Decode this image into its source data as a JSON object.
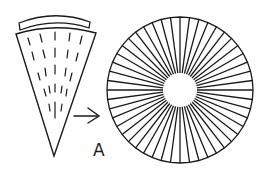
{
  "figure": {
    "panel_label": "A",
    "elements": [
      {
        "name": "cone-wedge",
        "description": "Conical wedge with curved cap and dashed internal lines"
      },
      {
        "name": "arrow",
        "description": "Arrow pointing from wedge to circular disc"
      },
      {
        "name": "radial-disc",
        "description": "Circular disc composed of radial segments around a hollow center"
      }
    ],
    "stroke_color": "#1a1a1a",
    "background_color": "#ffffff",
    "radial_segment_count": 48
  }
}
